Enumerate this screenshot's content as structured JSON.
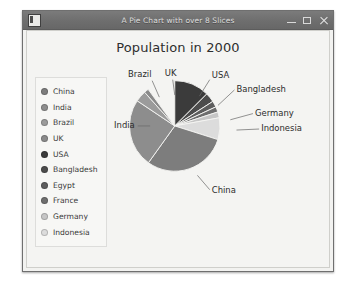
{
  "window": {
    "title": "A Pie Chart with over 8 Slices",
    "icon": "window-icon",
    "buttons": {
      "minimize": "minimize-button",
      "maximize": "maximize-button",
      "close": "close-button"
    }
  },
  "chart_data": {
    "type": "pie",
    "title": "Population in 2000",
    "xlabel": "",
    "ylabel": "",
    "legend_position": "left",
    "grid": false,
    "categories": [
      "China",
      "India",
      "Brazil",
      "UK",
      "USA",
      "Bangladesh",
      "Egypt",
      "France",
      "Germany",
      "Indonesia"
    ],
    "values": [
      30.0,
      24.5,
      4.0,
      1.6,
      12.5,
      3.4,
      2.2,
      1.9,
      2.1,
      7.8
    ],
    "unit": "percent",
    "colors": [
      "#7d7d7d",
      "#8d8d8d",
      "#9b9b9b",
      "#8a8a8a",
      "#3b3b3b",
      "#4c4c4c",
      "#5d5d5d",
      "#6e6e6e",
      "#c6c6c6",
      "#dcdcdc"
    ],
    "annotations": [
      "Brazil",
      "UK",
      "USA",
      "Bangladesh",
      "Germany",
      "Indonesia",
      "India",
      "China"
    ],
    "slices": [
      {
        "label": "USA",
        "value": 12.5,
        "color": "#3b3b3b",
        "start": 0.0,
        "end": 45.0,
        "callout": "USA",
        "show_label": true
      },
      {
        "label": "Bangladesh",
        "value": 3.4,
        "color": "#4c4c4c",
        "start": 45.0,
        "end": 57.2,
        "callout": "Bangladesh",
        "show_label": true
      },
      {
        "label": "Egypt",
        "value": 2.2,
        "color": "#5d5d5d",
        "start": 57.2,
        "end": 65.1,
        "callout": "",
        "show_label": false
      },
      {
        "label": "France",
        "value": 1.9,
        "color": "#6e6e6e",
        "start": 65.1,
        "end": 72.0,
        "callout": "",
        "show_label": false
      },
      {
        "label": "Germany",
        "value": 2.1,
        "color": "#c6c6c6",
        "start": 72.0,
        "end": 79.6,
        "callout": "Germany",
        "show_label": true
      },
      {
        "label": "Indonesia",
        "value": 7.8,
        "color": "#dcdcdc",
        "start": 79.6,
        "end": 107.6,
        "callout": "Indonesia",
        "show_label": true
      },
      {
        "label": "China",
        "value": 30.0,
        "color": "#7d7d7d",
        "start": 107.6,
        "end": 215.6,
        "callout": "China",
        "show_label": true
      },
      {
        "label": "India",
        "value": 24.5,
        "color": "#8d8d8d",
        "start": 215.6,
        "end": 303.8,
        "callout": "India",
        "show_label": true
      },
      {
        "label": "Brazil",
        "value": 4.0,
        "color": "#9b9b9b",
        "start": 303.8,
        "end": 318.2,
        "callout": "Brazil",
        "show_label": true
      },
      {
        "label": "UK",
        "value": 1.6,
        "color": "#8a8a8a",
        "start": 318.2,
        "end": 324.0,
        "callout": "UK",
        "show_label": true
      }
    ]
  },
  "legend": {
    "items": [
      {
        "label": "China",
        "color": "#7d7d7d"
      },
      {
        "label": "India",
        "color": "#8d8d8d"
      },
      {
        "label": "Brazil",
        "color": "#9b9b9b"
      },
      {
        "label": "UK",
        "color": "#8a8a8a"
      },
      {
        "label": "USA",
        "color": "#3b3b3b"
      },
      {
        "label": "Bangladesh",
        "color": "#4c4c4c"
      },
      {
        "label": "Egypt",
        "color": "#5d5d5d"
      },
      {
        "label": "France",
        "color": "#6e6e6e"
      },
      {
        "label": "Germany",
        "color": "#c6c6c6"
      },
      {
        "label": "Indonesia",
        "color": "#dcdcdc"
      }
    ]
  },
  "callout_labels": [
    {
      "name": "Brazil",
      "x": 28,
      "y": 10,
      "anchor": "middle",
      "line": [
        [
          40,
          14
        ],
        [
          47,
          30
        ]
      ]
    },
    {
      "name": "UK",
      "x": 58,
      "y": 9,
      "anchor": "middle",
      "line": [
        [
          60,
          13
        ],
        [
          62,
          28
        ]
      ]
    },
    {
      "name": "USA",
      "x": 98,
      "y": 11,
      "anchor": "start",
      "line": [
        [
          96,
          13
        ],
        [
          86,
          29
        ]
      ]
    },
    {
      "name": "Bangladesh",
      "x": 122,
      "y": 25,
      "anchor": "start",
      "line": [
        [
          120,
          23
        ],
        [
          104,
          38
        ]
      ]
    },
    {
      "name": "Germany",
      "x": 140,
      "y": 48,
      "anchor": "start",
      "line": [
        [
          138,
          46
        ],
        [
          116,
          52
        ]
      ]
    },
    {
      "name": "Indonesia",
      "x": 146,
      "y": 63,
      "anchor": "start",
      "line": [
        [
          144,
          61
        ],
        [
          122,
          62
        ]
      ]
    },
    {
      "name": "India",
      "x": 3,
      "y": 60,
      "anchor": "start",
      "line": [
        [
          26,
          58
        ],
        [
          38,
          58
        ]
      ]
    },
    {
      "name": "China",
      "x": 98,
      "y": 123,
      "anchor": "start",
      "line": [
        [
          96,
          120
        ],
        [
          84,
          106
        ]
      ]
    }
  ]
}
